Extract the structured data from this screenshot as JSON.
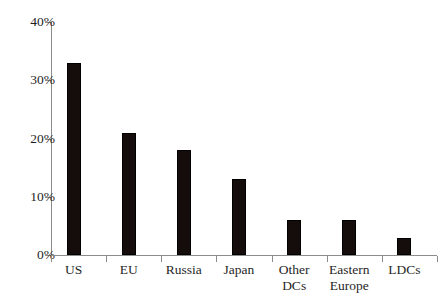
{
  "chart_data": {
    "type": "bar",
    "title": "",
    "subtitle": "",
    "xlabel": "",
    "ylabel": "",
    "categories": [
      "US",
      "EU",
      "Russia",
      "Japan",
      "Other DCs",
      "Eastern Europe",
      "LDCs"
    ],
    "values": [
      33,
      21,
      18,
      13,
      6,
      6,
      3
    ],
    "value_unit": "%",
    "ylim": [
      0,
      40
    ],
    "yticks": [
      0,
      10,
      20,
      30,
      40
    ],
    "ytick_labels": [
      "0%",
      "10%",
      "20%",
      "30%",
      "40%"
    ],
    "grid": false,
    "legend": false,
    "legend_position": "none",
    "series": [
      {
        "name": "",
        "values": [
          33,
          21,
          18,
          13,
          6,
          6,
          3
        ]
      }
    ],
    "bar_color": "#140d0c",
    "axis_color": "#8c8c8c",
    "background_color": "#ffffff"
  },
  "axis": {
    "y_tick_labels": [
      "40%",
      "30%",
      "20%",
      "10%",
      "0%"
    ]
  },
  "categories_display": [
    "US",
    "EU",
    "Russia",
    "Japan",
    "Other\nDCs",
    "Eastern\nEurope",
    "LDCs"
  ]
}
